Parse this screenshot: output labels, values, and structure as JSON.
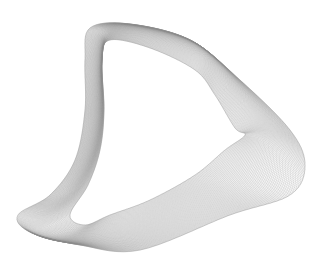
{
  "image": {
    "subject": "3D parametric wireframe mesh surface",
    "background_color": "#ffffff",
    "line_color": "#8c8c8c",
    "width": 332,
    "height": 273
  },
  "surface": {
    "outline": {
      "top_left_bulge": [
        90,
        28
      ],
      "top_center": [
        190,
        40
      ],
      "right_tip": [
        305,
        165
      ],
      "bottom": [
        140,
        250
      ],
      "left_tip": [
        18,
        215
      ]
    },
    "inner_fold_peak": [
      235,
      128
    ],
    "u_lines": 140,
    "v_lines": 140
  }
}
